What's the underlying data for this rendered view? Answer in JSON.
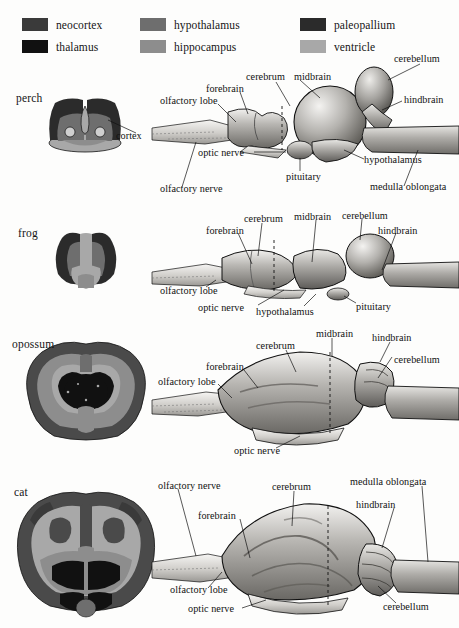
{
  "figure": {
    "background_color": "#fdfdfc",
    "text_color": "#111111"
  },
  "legend": {
    "items": [
      {
        "label": "neocortex",
        "color": "#3a3a3a",
        "col": 0,
        "row": 0
      },
      {
        "label": "thalamus",
        "color": "#111111",
        "col": 0,
        "row": 1
      },
      {
        "label": "hypothalamus",
        "color": "#6e6e6e",
        "col": 1,
        "row": 0
      },
      {
        "label": "hippocampus",
        "color": "#8d8d8d",
        "col": 1,
        "row": 1
      },
      {
        "label": "paleopallium",
        "color": "#2b2b2b",
        "col": 2,
        "row": 0
      },
      {
        "label": "ventricle",
        "color": "#a8a8a8",
        "col": 2,
        "row": 1
      }
    ]
  },
  "species_rows": [
    {
      "name": "perch",
      "name_pos": {
        "x": 16,
        "y": 92
      },
      "section_labels": [
        {
          "text": "cortex",
          "x": 116,
          "y": 136
        }
      ],
      "lateral_labels": [
        {
          "text": "olfactory lobe",
          "x": 160,
          "y": 100
        },
        {
          "text": "forebrain",
          "x": 206,
          "y": 88
        },
        {
          "text": "cerebrum",
          "x": 246,
          "y": 76
        },
        {
          "text": "midbrain",
          "x": 294,
          "y": 66
        },
        {
          "text": "cerebellum",
          "x": 394,
          "y": 57
        },
        {
          "text": "hindbrain",
          "x": 404,
          "y": 98
        },
        {
          "text": "hypothalamus",
          "x": 366,
          "y": 162
        },
        {
          "text": "medulla oblongata",
          "x": 372,
          "y": 189
        },
        {
          "text": "pituitary",
          "x": 288,
          "y": 175
        },
        {
          "text": "optic nerve",
          "x": 200,
          "y": 156
        },
        {
          "text": "olfactory nerve",
          "x": 160,
          "y": 190
        }
      ]
    },
    {
      "name": "frog",
      "name_pos": {
        "x": 18,
        "y": 227
      },
      "section_labels": [],
      "lateral_labels": [
        {
          "text": "forebrain",
          "x": 208,
          "y": 229
        },
        {
          "text": "cerebrum",
          "x": 246,
          "y": 218
        },
        {
          "text": "midbrain",
          "x": 296,
          "y": 216
        },
        {
          "text": "cerebellum",
          "x": 344,
          "y": 215
        },
        {
          "text": "hindbrain",
          "x": 380,
          "y": 229
        },
        {
          "text": "olfactory lobe",
          "x": 162,
          "y": 290
        },
        {
          "text": "optic nerve",
          "x": 207,
          "y": 308
        },
        {
          "text": "hypothalamus",
          "x": 260,
          "y": 310
        },
        {
          "text": "pituitary",
          "x": 360,
          "y": 307
        }
      ]
    },
    {
      "name": "opossum",
      "name_pos": {
        "x": 12,
        "y": 344
      },
      "section_labels": [],
      "lateral_labels": [
        {
          "text": "midbrain",
          "x": 318,
          "y": 333
        },
        {
          "text": "hindbrain",
          "x": 374,
          "y": 337
        },
        {
          "text": "cerebrum",
          "x": 258,
          "y": 345
        },
        {
          "text": "cerebellum",
          "x": 396,
          "y": 360
        },
        {
          "text": "forebrain",
          "x": 208,
          "y": 366
        },
        {
          "text": "olfactory lobe",
          "x": 160,
          "y": 380
        },
        {
          "text": "optic nerve",
          "x": 236,
          "y": 452
        }
      ]
    },
    {
      "name": "cat",
      "name_pos": {
        "x": 14,
        "y": 492
      },
      "section_labels": [],
      "lateral_labels": [
        {
          "text": "olfactory nerve",
          "x": 160,
          "y": 484
        },
        {
          "text": "cerebrum",
          "x": 274,
          "y": 486
        },
        {
          "text": "medulla oblongata",
          "x": 352,
          "y": 481
        },
        {
          "text": "hindbrain",
          "x": 358,
          "y": 504
        },
        {
          "text": "forebrain",
          "x": 200,
          "y": 515
        },
        {
          "text": "olfactory lobe",
          "x": 172,
          "y": 592
        },
        {
          "text": "optic nerve",
          "x": 190,
          "y": 611
        },
        {
          "text": "cerebellum",
          "x": 385,
          "y": 607
        }
      ]
    }
  ]
}
